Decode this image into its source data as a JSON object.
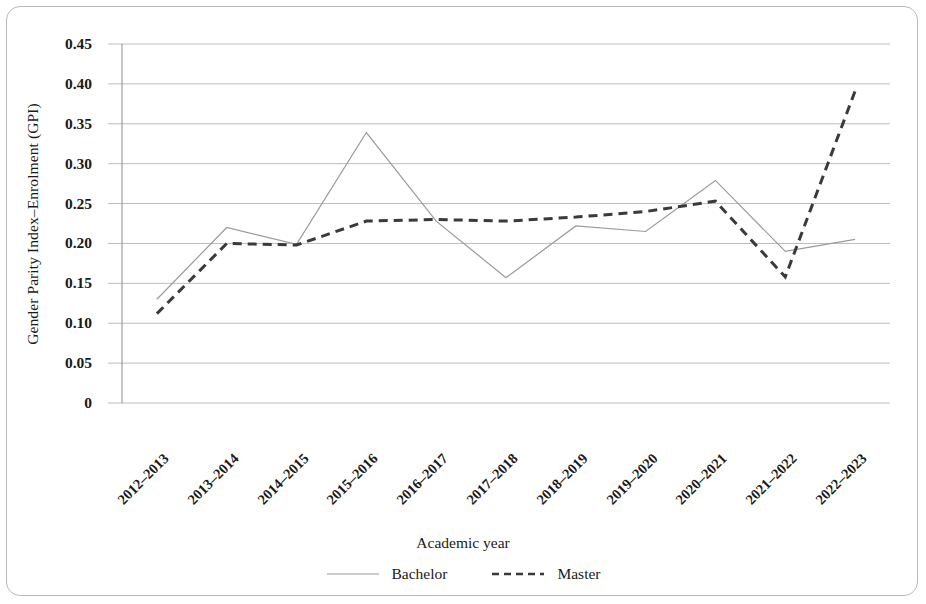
{
  "chart_data": {
    "type": "line",
    "title": "",
    "xlabel": "Academic year",
    "ylabel": "Gender Parity Index–Enrolment (GPI)",
    "categories": [
      "2012–2013",
      "2013–2014",
      "2014–2015",
      "2015–2016",
      "2016–2017",
      "2017–2018",
      "2018–2019",
      "2019–2020",
      "2020–2021",
      "2021–2022",
      "2022–2023"
    ],
    "series": [
      {
        "name": "Bachelor",
        "style": "solid",
        "color": "#9a9a9a",
        "values": [
          0.13,
          0.22,
          0.199,
          0.339,
          0.228,
          0.157,
          0.222,
          0.215,
          0.279,
          0.19,
          0.205
        ]
      },
      {
        "name": "Master",
        "style": "dashed",
        "color": "#3a3a3a",
        "values": [
          0.112,
          0.2,
          0.198,
          0.228,
          0.23,
          0.228,
          0.233,
          0.24,
          0.253,
          0.158,
          0.391
        ]
      }
    ],
    "ylim": [
      0,
      0.45
    ],
    "yticks": [
      0,
      0.05,
      0.1,
      0.15,
      0.2,
      0.25,
      0.3,
      0.35,
      0.4,
      0.45
    ],
    "ytick_labels": [
      "0",
      "0.05",
      "0.10",
      "0.15",
      "0.20",
      "0.25",
      "0.30",
      "0.35",
      "0.40",
      "0.45"
    ],
    "grid": true,
    "grid_color": "#bdbdbd",
    "legend_position": "bottom"
  },
  "legend": {
    "entries": [
      {
        "label": "Bachelor"
      },
      {
        "label": "Master"
      }
    ]
  }
}
